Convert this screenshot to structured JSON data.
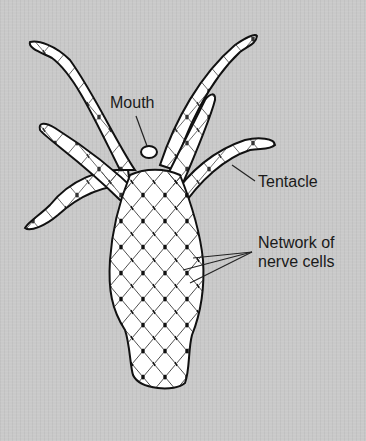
{
  "diagram": {
    "labels": {
      "mouth": "Mouth",
      "tentacle": "Tentacle",
      "network_line1": "Network of",
      "network_line2": "nerve cells"
    },
    "colors": {
      "background": "#c9c9c9",
      "body_fill": "#ffffff",
      "outline": "#111111"
    }
  }
}
